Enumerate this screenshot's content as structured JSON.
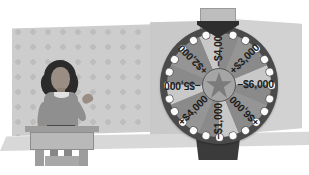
{
  "scene": {
    "title": "Game show prize wheel with contestant",
    "background_color": "#ffffff",
    "floor_color": "#d8d8d8"
  },
  "backdrop": {
    "panel_left_name": "polka-dot curtain panel",
    "panel_mid_name": "plain curtain panel",
    "panel_right_name": "plain curtain panel",
    "dot_color": "#bdbdbd",
    "panel_color": "#cdcdcd"
  },
  "contestant": {
    "name": "contestant",
    "hair_color": "#2b2b2b",
    "skin_color": "#9a8e84",
    "shirt_color": "#8f8f8f",
    "belt_color": "#4a4a4a",
    "pose": "right hand raised, standing behind podium"
  },
  "podium": {
    "name": "podium",
    "top_color": "#9d9d9d",
    "panel_color": "#b9b9b9"
  },
  "wheel": {
    "name": "prize wheel",
    "rim_color": "#4a4a4a",
    "bulb_color": "#fafafa",
    "bulb_count": 24,
    "hub_icon": "star-icon",
    "hub_color": "#7b7b7b",
    "pointer_color": "#2e2e2e",
    "base_color": "#3b3b3b",
    "wedge_light_color": "#c8c8c8",
    "wedge_dark_color": "#959595",
    "segments": [
      {
        "label": "−$4,000",
        "amount": -4000,
        "position": "top",
        "angle": 0,
        "shade": "light"
      },
      {
        "label": "+$3,000",
        "amount": 3000,
        "position": "upper-right",
        "angle": 45,
        "shade": "dark"
      },
      {
        "label": "−$6,000",
        "amount": -6000,
        "position": "right",
        "angle": 90,
        "shade": "light"
      },
      {
        "label": "+$6,000",
        "amount": 6000,
        "position": "lower-right",
        "angle": 135,
        "shade": "dark"
      },
      {
        "label": "−$1,000",
        "amount": -1000,
        "position": "bottom",
        "angle": 180,
        "shade": "light"
      },
      {
        "label": "+$4,000",
        "amount": 4000,
        "position": "lower-left",
        "angle": 225,
        "shade": "dark"
      },
      {
        "label": "−$5,000",
        "amount": -5000,
        "position": "left",
        "angle": 270,
        "shade": "light"
      },
      {
        "label": "+$2,000",
        "amount": 2000,
        "position": "upper-left",
        "angle": 315,
        "shade": "dark"
      }
    ]
  },
  "chart_data": {
    "type": "pie",
    "categories": [
      "−$4,000",
      "+$3,000",
      "−$6,000",
      "+$6,000",
      "−$1,000",
      "+$4,000",
      "−$5,000",
      "+$2,000"
    ],
    "values": [
      12.5,
      12.5,
      12.5,
      12.5,
      12.5,
      12.5,
      12.5,
      12.5
    ],
    "data_labels": [
      "−$4,000",
      "+$3,000",
      "−$6,000",
      "+$6,000",
      "−$1,000",
      "+$4,000",
      "−$5,000",
      "+$2,000"
    ],
    "amounts": [
      -4000,
      3000,
      -6000,
      6000,
      -1000,
      4000,
      -5000,
      2000
    ],
    "xlabel": "",
    "ylabel": "",
    "grid": false,
    "legend": "none",
    "note": "Eight equal 45-degree sectors; each sector equally likely (12.5%)."
  }
}
